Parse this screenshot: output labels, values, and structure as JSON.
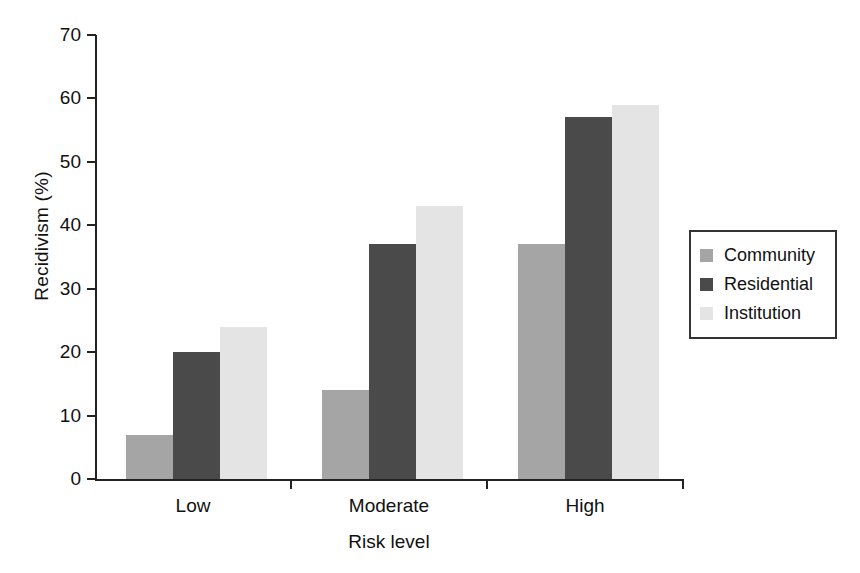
{
  "chart_data": {
    "type": "bar",
    "title": "",
    "xlabel": "Risk level",
    "ylabel": "Recidivism (%)",
    "categories": [
      "Low",
      "Moderate",
      "High"
    ],
    "series": [
      {
        "name": "Community",
        "values": [
          7,
          14,
          37
        ],
        "color": "#a5a5a5"
      },
      {
        "name": "Residential",
        "values": [
          20,
          37,
          57
        ],
        "color": "#4a4a4a"
      },
      {
        "name": "Institution",
        "values": [
          24,
          43,
          59
        ],
        "color": "#e4e4e4"
      }
    ],
    "ylim": [
      0,
      70
    ],
    "yticks": [
      0,
      10,
      20,
      30,
      40,
      50,
      60,
      70
    ],
    "ytick_labels": [
      "0",
      "10",
      "20",
      "30",
      "40",
      "50",
      "60",
      "70"
    ],
    "grid": false,
    "legend_position": "right-outside",
    "legend_entries": [
      "Community",
      "Residential",
      "Institution"
    ],
    "axis_color": "#222222",
    "background": "#ffffff"
  }
}
